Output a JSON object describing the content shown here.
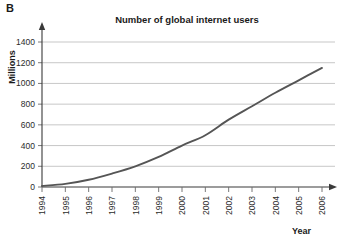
{
  "panel": {
    "letter": "B"
  },
  "axis_titles": {
    "y": "Millions",
    "x": "Year"
  },
  "chart_data": {
    "type": "line",
    "title": "Number of global internet users",
    "xlabel": "Year",
    "ylabel": "Millions",
    "categories": [
      "1994",
      "1995",
      "1996",
      "1997",
      "1998",
      "1999",
      "2000",
      "2001",
      "2002",
      "2003",
      "2004",
      "2005",
      "2006"
    ],
    "x": [
      1994,
      1995,
      1996,
      1997,
      1998,
      1999,
      2000,
      2001,
      2002,
      2003,
      2004,
      2005,
      2006
    ],
    "values": [
      10,
      30,
      70,
      130,
      200,
      290,
      400,
      500,
      650,
      780,
      910,
      1030,
      1150
    ],
    "series": [
      {
        "name": "Global internet users",
        "values": [
          10,
          30,
          70,
          130,
          200,
          290,
          400,
          500,
          650,
          780,
          910,
          1030,
          1150
        ],
        "color": "#555555"
      }
    ],
    "ylim": [
      0,
      1400
    ],
    "yticks": [
      0,
      200,
      400,
      600,
      800,
      1000,
      1200,
      1400
    ],
    "ytick_labels": [
      "0",
      "200",
      "400",
      "600",
      "800",
      "1000",
      "1200",
      "1400"
    ],
    "xlim": [
      1994,
      2006
    ],
    "xticks": [
      1994,
      1995,
      1996,
      1997,
      1998,
      1999,
      2000,
      2001,
      2002,
      2003,
      2004,
      2005,
      2006
    ],
    "xtick_labels": [
      "1994",
      "1995",
      "1996",
      "1997",
      "1998",
      "1999",
      "2000",
      "2001",
      "2002",
      "2003",
      "2004",
      "2005",
      "2006"
    ],
    "xtick_rotation": -90,
    "grid": "horizontal",
    "legend": "none",
    "gridline_color": "#b9b9b9",
    "axis_color": "#3a3a3a",
    "background": "#ffffff"
  }
}
